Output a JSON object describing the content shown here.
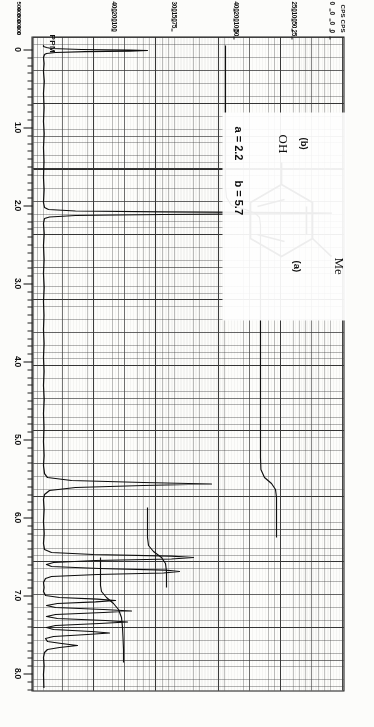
{
  "document": {
    "kind": "nmr-spectrum-chart",
    "orientation": "rotated-90-clockwise"
  },
  "axes": {
    "ppm": {
      "unit_label": "PPM",
      "ticks": [
        "0",
        "1.0",
        "2.0",
        "3.0",
        "4.0",
        "5.0",
        "6.0",
        "7.0",
        "8.0"
      ],
      "range": [
        0,
        8.4
      ],
      "direction": "left-to-right-increasing"
    },
    "cps": {
      "unit_label": "CPS",
      "header_left": "CPS",
      "header_right": "CPS",
      "rows": [
        {
          "values": [
            "0",
            "0",
            "0",
            "0"
          ]
        },
        {
          "values": [
            "250",
            "100",
            "50",
            "25"
          ]
        },
        {
          "values": [
            "400",
            "200",
            "100",
            "50"
          ]
        },
        {
          "values": [
            "300",
            "150",
            "75"
          ]
        },
        {
          "values": [
            "400",
            "200",
            "100"
          ]
        }
      ],
      "bottom_scale": [
        "500",
        "400",
        "300",
        "200",
        "100",
        "0"
      ]
    }
  },
  "structure": {
    "ring_name": "benzene-ring",
    "substituents": [
      {
        "formula": "Me",
        "tag": "(a)",
        "position": "meta-top"
      },
      {
        "formula": "OH",
        "tag": "(b)",
        "position": "left"
      }
    ],
    "annotations": [
      {
        "text": "a = 2.2"
      },
      {
        "text": "b = 5.7"
      }
    ]
  },
  "chart_data": {
    "type": "line",
    "title": "",
    "xlabel": "PPM",
    "ylabel": "CPS",
    "xlim": [
      0,
      8.4
    ],
    "ylim": [
      0,
      1
    ],
    "grid": true,
    "legend": "none",
    "x_tick_labels": [
      "0",
      "1.0",
      "2.0",
      "3.0",
      "4.0",
      "5.0",
      "6.0",
      "7.0",
      "8.0"
    ],
    "annotations": [
      "a = 2.2",
      "b = 5.7",
      "Me",
      "OH",
      "(a)",
      "(b)"
    ],
    "peaks": [
      {
        "ppm": 0.0,
        "height": 0.34,
        "width": 0.055,
        "label": "TMS reference"
      },
      {
        "ppm": 2.22,
        "height": 0.97,
        "width": 0.03,
        "label": "a (CH3)"
      },
      {
        "ppm": 5.7,
        "height": 0.6,
        "width": 0.045,
        "label": "b (OH)"
      },
      {
        "ppm": 6.62,
        "height": 0.5,
        "width": 0.028,
        "label": "aromatic"
      },
      {
        "ppm": 6.7,
        "height": 0.42,
        "width": 0.026,
        "label": "aromatic"
      },
      {
        "ppm": 6.95,
        "height": 0.26,
        "width": 0.022,
        "label": "aromatic"
      },
      {
        "ppm": 7.02,
        "height": 0.3,
        "width": 0.022,
        "label": "aromatic"
      },
      {
        "ppm": 7.1,
        "height": 0.22,
        "width": 0.022,
        "label": "aromatic"
      },
      {
        "ppm": 7.17,
        "height": 0.18,
        "width": 0.022,
        "label": "aromatic"
      }
    ],
    "integral_steps": [
      {
        "ppm_start": 1.9,
        "ppm_end": 2.5,
        "rise": 0.36
      },
      {
        "ppm_start": 5.4,
        "ppm_end": 5.9,
        "rise": 0.22
      },
      {
        "ppm_start": 6.4,
        "ppm_end": 7.3,
        "rise": 0.3
      }
    ]
  }
}
